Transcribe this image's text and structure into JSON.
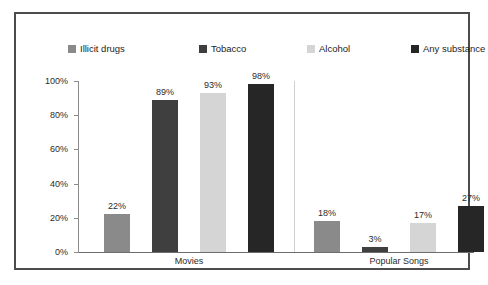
{
  "chart_data": {
    "type": "bar",
    "title": "",
    "subtitle": "",
    "xlabel": "",
    "ylabel": "",
    "ylim": [
      0,
      100
    ],
    "yticks": [
      "0%",
      "20%",
      "40%",
      "60%",
      "80%",
      "100%"
    ],
    "ytick_values": [
      0,
      20,
      40,
      60,
      80,
      100
    ],
    "grid": false,
    "legend_position": "top",
    "categories": [
      "Movies",
      "Popular Songs"
    ],
    "series": [
      {
        "name": "Illicit drugs",
        "color": "#8a8a8a",
        "values": [
          22,
          18
        ],
        "labels": [
          "22%",
          "18%"
        ]
      },
      {
        "name": "Tobacco",
        "color": "#3f3f3f",
        "values": [
          89,
          3
        ],
        "labels": [
          "89%",
          "3%"
        ]
      },
      {
        "name": "Alcohol",
        "color": "#d5d5d5",
        "values": [
          93,
          17
        ],
        "labels": [
          "93%",
          "17%"
        ]
      },
      {
        "name": "Any substance",
        "color": "#262626",
        "values": [
          98,
          27
        ],
        "labels": [
          "98%",
          "27%"
        ]
      }
    ]
  },
  "colors": {
    "frame_border": "#4c4c4c",
    "axis": "#8c8c8c",
    "divider": "#d0d0d0",
    "text": "#2b2b2b",
    "background": "#ffffff"
  }
}
